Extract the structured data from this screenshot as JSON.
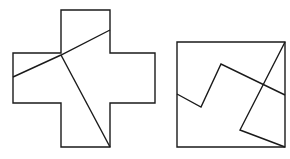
{
  "figure": {
    "title": "Two outlined plane figures partitioned by straight chords",
    "background_color": "#ffffff",
    "stroke_color": "#1a1a1a",
    "stroke_width": 1.4,
    "canvas": {
      "width": 290,
      "height": 159
    },
    "shapes": [
      {
        "id": "cross-shape",
        "name": "greek-cross-polygon",
        "kind": "outline-polygon",
        "label": "Plus / Greek cross outline",
        "points": "61,10 110,10 110,53 155,53 155,103 110,103 110,147 61,147 61,103 13,103 13,53 61,53",
        "chords": [
          {
            "id": "cross-chord-1",
            "name": "cross-chord-upper-left",
            "label": "Chord from left arm edge to top arm right edge",
            "points": "13,77 61,55 110,30"
          },
          {
            "id": "cross-chord-2",
            "name": "cross-chord-lower-right",
            "label": "Chord from interior corner to bottom arm right corner",
            "points": "61,55 110,147"
          }
        ]
      },
      {
        "id": "square-shape",
        "name": "square-polygon",
        "kind": "outline-polygon",
        "label": "Square outline",
        "points": "177,42 285,42 285,147 177,147",
        "chords": [
          {
            "id": "square-chord-1",
            "name": "square-chord-zigzag",
            "label": "Zigzag chord from left edge across to right edge",
            "points": "177,94 201,107 221,64 285,95"
          },
          {
            "id": "square-chord-2",
            "name": "square-chord-vee",
            "label": "V chord from top-right corner to bottom-right corner",
            "points": "285,42 240,130 285,147"
          }
        ]
      }
    ]
  }
}
